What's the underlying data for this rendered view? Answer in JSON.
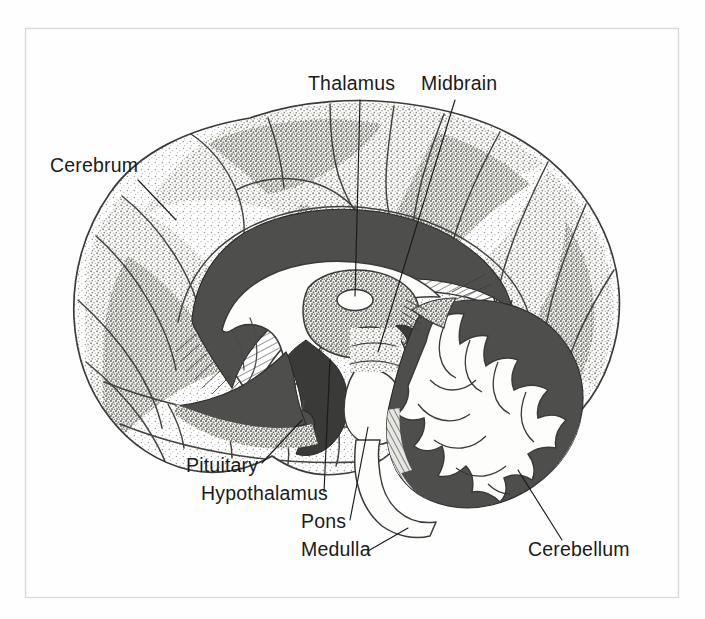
{
  "figure": {
    "kind": "anatomical-illustration",
    "style": "pen-and-ink stipple line drawing",
    "background_color": "#fefefe",
    "ink_color": "#1a1a1a",
    "frame_color": "#d8d8d8",
    "shade_color": "#4e4e4c",
    "label_font_size_px": 19.5
  },
  "labels": [
    {
      "id": "cerebrum",
      "text": "Cerebrum",
      "text_x": 50,
      "text_y": 172,
      "anchor": "start",
      "leader": "M 138 180 L 176 220"
    },
    {
      "id": "thalamus",
      "text": "Thalamus",
      "text_x": 308,
      "text_y": 90,
      "anchor": "start",
      "leader": "M 360 100 L 355 296"
    },
    {
      "id": "midbrain",
      "text": "Midbrain",
      "text_x": 421,
      "text_y": 90,
      "anchor": "start",
      "leader": "M 455 100 L 378 352"
    },
    {
      "id": "pituitary",
      "text": "Pituitary",
      "text_x": 186,
      "text_y": 472,
      "anchor": "start",
      "leader": "M 262 463 L 302 420"
    },
    {
      "id": "hypothalamus",
      "text": "Hypothalamus",
      "text_x": 201,
      "text_y": 500,
      "anchor": "start",
      "leader": "M 324 492 L 330 360"
    },
    {
      "id": "pons",
      "text": "Pons",
      "text_x": 301,
      "text_y": 528,
      "anchor": "start",
      "leader": "M 350 520 L 368 427"
    },
    {
      "id": "medulla",
      "text": "Medulla",
      "text_x": 301,
      "text_y": 556,
      "anchor": "start",
      "leader": "M 368 551 L 408 528"
    },
    {
      "id": "cerebellum",
      "text": "Cerebellum",
      "text_x": 528,
      "text_y": 556,
      "anchor": "start",
      "leader": "M 562 540 L 518 470"
    }
  ],
  "structures": [
    {
      "id": "cerebrum",
      "name": "Cerebrum",
      "note": "large convoluted cortex, stippled shading"
    },
    {
      "id": "corpus-callosum",
      "name": "Corpus callosum",
      "note": "arched band with radiating hatch lines"
    },
    {
      "id": "thalamus",
      "name": "Thalamus",
      "note": "small white oval at center"
    },
    {
      "id": "midbrain",
      "name": "Midbrain",
      "note": "brainstem above pons"
    },
    {
      "id": "pituitary",
      "name": "Pituitary",
      "note": "small gland below hypothalamus"
    },
    {
      "id": "hypothalamus",
      "name": "Hypothalamus",
      "note": "region below thalamus"
    },
    {
      "id": "pons",
      "name": "Pons",
      "note": "bulging white brainstem segment"
    },
    {
      "id": "medulla",
      "name": "Medulla",
      "note": "lowest brainstem segment"
    },
    {
      "id": "cerebellum",
      "name": "Cerebellum",
      "note": "arbor vitae branching white-matter pattern"
    }
  ]
}
